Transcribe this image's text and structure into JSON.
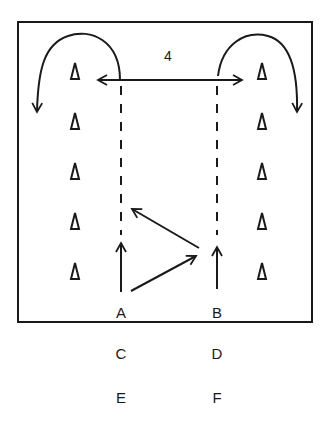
{
  "diagram": {
    "type": "sports-drill",
    "field": {
      "x": 18,
      "y": 22,
      "width": 294,
      "height": 300,
      "stroke": "#1a1a1a"
    },
    "distance_label": {
      "text": "4",
      "x": 168,
      "y": 56
    },
    "cones": {
      "left": [
        {
          "x": 75,
          "y": 72
        },
        {
          "x": 75,
          "y": 122
        },
        {
          "x": 75,
          "y": 172
        },
        {
          "x": 75,
          "y": 222
        },
        {
          "x": 75,
          "y": 272
        }
      ],
      "right": [
        {
          "x": 262,
          "y": 72
        },
        {
          "x": 262,
          "y": 122
        },
        {
          "x": 262,
          "y": 172
        },
        {
          "x": 262,
          "y": 222
        },
        {
          "x": 262,
          "y": 272
        }
      ]
    },
    "players": [
      {
        "label": "A",
        "x": 121,
        "y": 312
      },
      {
        "label": "B",
        "x": 217,
        "y": 312
      },
      {
        "label": "C",
        "x": 121,
        "y": 353
      },
      {
        "label": "D",
        "x": 217,
        "y": 353
      },
      {
        "label": "E",
        "x": 121,
        "y": 397
      },
      {
        "label": "F",
        "x": 217,
        "y": 397
      }
    ],
    "paths": [
      {
        "name": "double-arrow-horizontal",
        "style": "solid"
      },
      {
        "name": "dashed-run-A",
        "style": "dashed"
      },
      {
        "name": "dashed-run-B",
        "style": "dashed"
      },
      {
        "name": "run-up-A",
        "style": "solid"
      },
      {
        "name": "run-up-B",
        "style": "solid"
      },
      {
        "name": "pass-A-to-B",
        "style": "solid"
      },
      {
        "name": "pass-B-to-A",
        "style": "solid"
      },
      {
        "name": "curl-left",
        "style": "solid"
      },
      {
        "name": "curl-right",
        "style": "solid"
      }
    ],
    "colors": {
      "ink": "#1a1a1a",
      "background": "#ffffff"
    }
  }
}
